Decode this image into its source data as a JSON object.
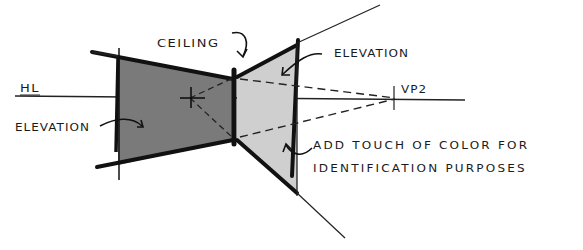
{
  "diagram": {
    "type": "two-point perspective interior sketch",
    "labels": {
      "horizon_line": "HL",
      "vanishing_point": "VP2",
      "ceiling": "CEILING",
      "elevation_left": "ELEVATION",
      "elevation_right": "ELEVATION",
      "note_line1": "ADD TOUCH OF COLOR FOR",
      "note_line2": "IDENTIFICATION PURPOSES"
    },
    "colors": {
      "left_elevation_fill": "#7a7a7a",
      "right_elevation_fill": "#cfcfcf",
      "ink": "#1a1a1a",
      "background": "#ffffff"
    }
  }
}
